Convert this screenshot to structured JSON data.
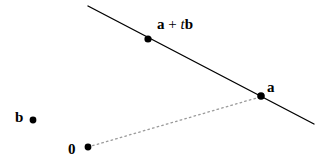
{
  "figure": {
    "background_color": "#ffffff",
    "width": 336,
    "height": 168
  },
  "labels": {
    "point_a_plus_tb": {
      "vector_a": "a",
      "operator": " + ",
      "scalar_t": "t",
      "vector_b": "b",
      "full_text": "a + tb"
    },
    "point_a": "a",
    "point_b": "b",
    "origin": "0"
  },
  "colors": {
    "line": "#000000",
    "dotted_line": "#999999",
    "point": "#000000",
    "text": "#000000"
  },
  "geometry": {
    "solid_line": {
      "name": "line-through-a",
      "x1": 88,
      "y1": 6,
      "x2": 314,
      "y2": 124,
      "stroke_width": 1.4,
      "style": "solid"
    },
    "dotted_line": {
      "name": "vector-from-origin-to-a",
      "x1": 88,
      "y1": 147,
      "x2": 260,
      "y2": 97,
      "stroke_width": 1.2,
      "style": "dotted"
    },
    "points": [
      {
        "name": "point-a-plus-tb",
        "cx": 148,
        "cy": 39,
        "r": 3.6
      },
      {
        "name": "point-a",
        "cx": 261,
        "cy": 96,
        "r": 3.8
      },
      {
        "name": "point-b",
        "cx": 33,
        "cy": 120,
        "r": 3.4
      },
      {
        "name": "point-origin",
        "cx": 88,
        "cy": 147,
        "r": 3.4
      }
    ]
  }
}
